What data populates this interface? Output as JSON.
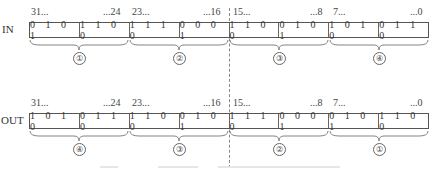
{
  "diagram": {
    "rows": [
      {
        "label": "IN",
        "bit_labels": [
          "31...",
          "...24",
          "23...",
          "...16",
          "15...",
          "...8",
          "7...",
          "...0"
        ],
        "nibbles": [
          "0 1 0 1",
          "1 1 0 0",
          "1 1 1 0",
          "0 0 0 1",
          "1 1 0 0",
          "0 1 0 1",
          "1 0 1 0",
          "0 1 1 0"
        ],
        "byte_groups": [
          "①",
          "②",
          "③",
          "④"
        ]
      },
      {
        "label": "OUT",
        "bit_labels": [
          "31...",
          "...24",
          "23...",
          "...16",
          "15...",
          "...8",
          "7...",
          "...0"
        ],
        "nibbles": [
          "1 0 1 0",
          "0 1 1 0",
          "1 1 0 0",
          "0 1 0 1",
          "1 1 1 0",
          "0 0 0 1",
          "0 1 0 1",
          "1 1 0 0"
        ],
        "byte_groups": [
          "④",
          "③",
          "②",
          "①"
        ]
      }
    ],
    "divider": "dashed vertical line between bit 16 and bit 15",
    "caption": ""
  }
}
